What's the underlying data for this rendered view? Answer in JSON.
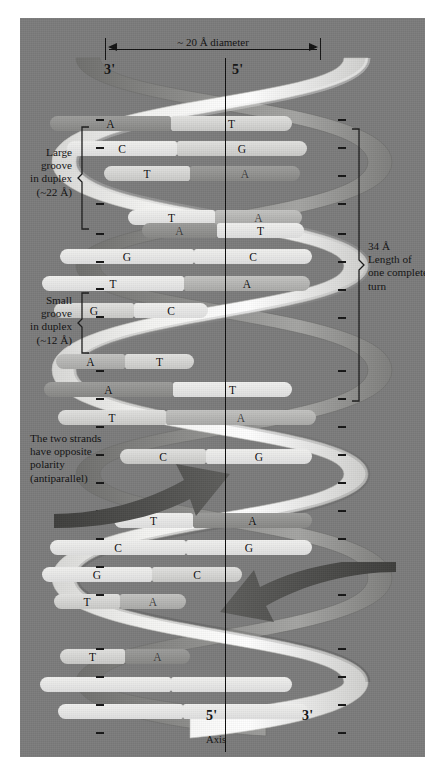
{
  "figure": {
    "background_color": "#ffffff",
    "panel_color": "#7b7b7b"
  },
  "dimension": {
    "label": "~ 20 Å diameter"
  },
  "strand_labels": {
    "top_left": "3'",
    "top_right": "5'",
    "bottom_left": "5'",
    "bottom_right": "3'",
    "axis_caption": "Axis"
  },
  "annotations": {
    "large_groove": "Large\ngroove\nin duplex\n(~22 Å)",
    "large_groove_lines": [
      "Large",
      "groove",
      "in duplex",
      "(~22 Å)"
    ],
    "small_groove_lines": [
      "Small",
      "groove",
      "in duplex",
      "(~12 Å)"
    ],
    "turn_length_lines": [
      "34 Å",
      "Length of",
      "one complete",
      "turn"
    ],
    "polarity_lines": [
      "The two strands",
      "have opposite",
      "polarity",
      "(antiparallel)"
    ]
  },
  "base_pairs": [
    {
      "left": "A",
      "right": "T",
      "y": 98,
      "x": 30,
      "w": 242,
      "split": 0.5,
      "lf": "f-dark",
      "rf": "f-light",
      "ldim": false,
      "rdim": false
    },
    {
      "left": "C",
      "right": "G",
      "y": 123,
      "x": 47,
      "w": 240,
      "split": 0.46,
      "lf": "f-lightest",
      "rf": "f-light",
      "ldim": false,
      "rdim": false
    },
    {
      "left": "T",
      "right": "A",
      "y": 148,
      "x": 84,
      "w": 196,
      "split": 0.44,
      "lf": "f-light",
      "rf": "f-dark",
      "ldim": false,
      "rdim": true
    },
    {
      "left": "T",
      "right": "A",
      "y": 192,
      "x": 108,
      "w": 174,
      "split": 0.5,
      "lf": "f-lightest",
      "rf": "f-mid",
      "ldim": false,
      "rdim": true
    },
    {
      "left": "A",
      "right": "T",
      "y": 205,
      "x": 122,
      "w": 162,
      "split": 0.46,
      "lf": "f-dark",
      "rf": "f-lightest",
      "ldim": true,
      "rdim": false
    },
    {
      "left": "G",
      "right": "C",
      "y": 231,
      "x": 40,
      "w": 252,
      "split": 0.53,
      "lf": "f-lightest",
      "rf": "f-lightest",
      "ldim": false,
      "rdim": false
    },
    {
      "left": "T",
      "right": "A",
      "y": 258,
      "x": 22,
      "w": 268,
      "split": 0.53,
      "lf": "f-lightest",
      "rf": "f-mid",
      "ldim": false,
      "rdim": false
    },
    {
      "left": "G",
      "right": "C",
      "y": 285,
      "x": 34,
      "w": 154,
      "split": 0.52,
      "lf": "f-light",
      "rf": "f-lightest",
      "ldim": false,
      "rdim": false
    },
    {
      "left": "A",
      "right": "T",
      "y": 336,
      "x": 36,
      "w": 138,
      "split": 0.5,
      "lf": "f-mid",
      "rf": "f-light",
      "ldim": false,
      "rdim": false
    },
    {
      "left": "A",
      "right": "T",
      "y": 364,
      "x": 24,
      "w": 248,
      "split": 0.52,
      "lf": "f-dark",
      "rf": "f-lightest",
      "ldim": false,
      "rdim": false
    },
    {
      "left": "T",
      "right": "A",
      "y": 392,
      "x": 38,
      "w": 258,
      "split": 0.42,
      "lf": "f-light",
      "rf": "f-mid",
      "ldim": false,
      "rdim": true
    },
    {
      "left": "C",
      "right": "G",
      "y": 431,
      "x": 100,
      "w": 192,
      "split": 0.45,
      "lf": "f-light",
      "rf": "f-lightest",
      "ldim": false,
      "rdim": false
    },
    {
      "left": "T",
      "right": "A",
      "y": 495,
      "x": 94,
      "w": 198,
      "split": 0.4,
      "lf": "f-lightest",
      "rf": "f-dark",
      "ldim": false,
      "rdim": false
    },
    {
      "left": "C",
      "right": "G",
      "y": 522,
      "x": 30,
      "w": 262,
      "split": 0.52,
      "lf": "f-lightest",
      "rf": "f-lightest",
      "ldim": false,
      "rdim": false
    },
    {
      "left": "G",
      "right": "C",
      "y": 549,
      "x": 22,
      "w": 200,
      "split": 0.55,
      "lf": "f-lightest",
      "rf": "f-light",
      "ldim": false,
      "rdim": false
    },
    {
      "left": "T",
      "right": "A",
      "y": 576,
      "x": 34,
      "w": 132,
      "split": 0.5,
      "lf": "f-light",
      "rf": "f-mid",
      "ldim": false,
      "rdim": true
    },
    {
      "left": "T",
      "right": "A",
      "y": 631,
      "x": 40,
      "w": 130,
      "split": 0.5,
      "lf": "f-light",
      "rf": "f-dark",
      "ldim": false,
      "rdim": true
    },
    {
      "left": "",
      "right": "",
      "y": 659,
      "x": 20,
      "w": 252,
      "split": 0.52,
      "lf": "f-lightest",
      "rf": "f-lightest",
      "ldim": false,
      "rdim": false
    },
    {
      "left": "",
      "right": "",
      "y": 686,
      "x": 38,
      "w": 250,
      "split": 0.5,
      "lf": "f-lightest",
      "rf": "f-lightest",
      "ldim": false,
      "rdim": false
    }
  ],
  "phosphate_ticks_left_y": [
    101,
    129,
    185,
    215,
    243,
    270,
    298,
    352,
    380,
    408,
    436,
    464,
    492,
    520,
    548,
    576,
    630,
    658,
    686,
    714
  ],
  "phosphate_ticks_right_y": [
    101,
    129,
    157,
    185,
    215,
    243,
    271,
    299,
    352,
    380,
    408,
    436,
    464,
    492,
    520,
    548,
    576,
    630,
    658,
    686,
    714
  ],
  "colors": {
    "panel": "#7b7b7b",
    "ribbon_light": "#ededeb",
    "ribbon_mid": "#b9b9b7",
    "ribbon_dark": "#8d8d8b",
    "ink": "#111111"
  }
}
